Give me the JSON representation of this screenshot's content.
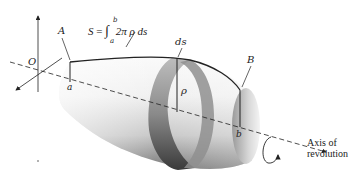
{
  "figure": {
    "formula": {
      "lhs": "S",
      "equals": "=",
      "integral": "∫",
      "upper_limit": "b",
      "lower_limit": "a",
      "integrand": "2π ρ ds"
    },
    "labels": {
      "origin": "O",
      "point_A": "A",
      "point_B": "B",
      "limit_a": "a",
      "limit_b": "b",
      "arc_element": "ds",
      "radius": "ρ"
    },
    "axis_label_line1": "Axis of",
    "axis_label_line2": "revolution",
    "colors": {
      "ink": "#222222",
      "surface_light": "#f2f2f2",
      "surface_dark": "#5a5a5a",
      "band": "#8a8a8a"
    }
  }
}
